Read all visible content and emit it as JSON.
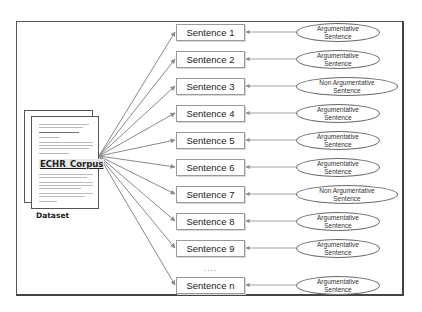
{
  "diagram": {
    "dataset": {
      "label": "Dataset",
      "document_title": "ECHR_Corpus"
    },
    "sentences": [
      {
        "label": "Sentence 1",
        "y": 32,
        "class": "Argumentative Sentence",
        "class_line1": "Argumentative",
        "class_line2": "Sentence",
        "non": false
      },
      {
        "label": "Sentence 2",
        "y": 59,
        "class": "Argumentative Sentence",
        "class_line1": "Argumentative",
        "class_line2": "Sentence",
        "non": false
      },
      {
        "label": "Sentence 3",
        "y": 86,
        "class": "Non Argumentative Sentence",
        "class_line1": "Non Argumentative",
        "class_line2": "Sentence",
        "non": true
      },
      {
        "label": "Sentence 4",
        "y": 113,
        "class": "Argumentative Sentence",
        "class_line1": "Argumentative",
        "class_line2": "Sentence",
        "non": false
      },
      {
        "label": "Sentence 5",
        "y": 140,
        "class": "Argumentative Sentence",
        "class_line1": "Argumentative",
        "class_line2": "Sentence",
        "non": false
      },
      {
        "label": "Sentence 6",
        "y": 167,
        "class": "Argumentative Sentence",
        "class_line1": "Argumentative",
        "class_line2": "Sentence",
        "non": false
      },
      {
        "label": "Sentence 7",
        "y": 194,
        "class": "Non Argumentative Sentence",
        "class_line1": "Non Argumentative",
        "class_line2": "Sentence",
        "non": true
      },
      {
        "label": "Sentence 8",
        "y": 221,
        "class": "Argumentative Sentence",
        "class_line1": "Argumentative",
        "class_line2": "Sentence",
        "non": false
      },
      {
        "label": "Sentence 9",
        "y": 248,
        "class": "Argumentative Sentence",
        "class_line1": "Argumentative",
        "class_line2": "Sentence",
        "non": false
      },
      {
        "label": "Sentence n",
        "y": 285,
        "class": "Argumentative Sentence",
        "class_line1": "Argumentative",
        "class_line2": "Sentence",
        "non": false
      }
    ],
    "ellipsis": "....",
    "colors": {
      "border": "#555555",
      "arrow": "#8a8a8a",
      "box_border": "#9a9a9a"
    }
  }
}
